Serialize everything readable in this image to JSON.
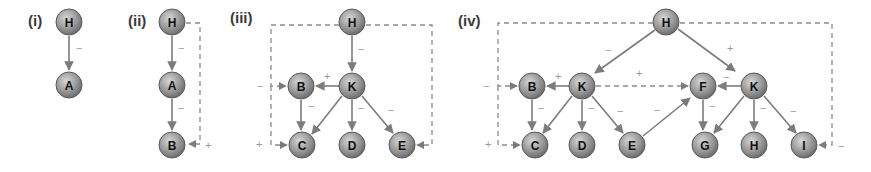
{
  "diagram": {
    "colors": {
      "node_fill": "#8f8f8f",
      "node_highlight": "#d8d8d8",
      "node_stroke": "#5a5a5a",
      "edge": "#7c7c7c",
      "sign": "#9a9a9a",
      "label": "#111111"
    },
    "panels": [
      {
        "label": "(i)",
        "nodes": [
          {
            "id": "H",
            "label": "H"
          },
          {
            "id": "A",
            "label": "A"
          }
        ],
        "edges": [
          {
            "from": "H",
            "to": "A",
            "sign": "−",
            "style": "solid"
          }
        ]
      },
      {
        "label": "(ii)",
        "nodes": [
          {
            "id": "H",
            "label": "H"
          },
          {
            "id": "A",
            "label": "A"
          },
          {
            "id": "B",
            "label": "B"
          }
        ],
        "edges": [
          {
            "from": "H",
            "to": "A",
            "sign": "−",
            "style": "solid"
          },
          {
            "from": "A",
            "to": "B",
            "sign": "−",
            "style": "solid"
          },
          {
            "from": "H",
            "to": "B",
            "sign": "+",
            "style": "dashed"
          }
        ]
      },
      {
        "label": "(iii)",
        "nodes": [
          {
            "id": "H",
            "label": "H"
          },
          {
            "id": "K",
            "label": "K"
          },
          {
            "id": "B",
            "label": "B"
          },
          {
            "id": "C",
            "label": "C"
          },
          {
            "id": "D",
            "label": "D"
          },
          {
            "id": "E",
            "label": "E"
          }
        ],
        "edges": [
          {
            "from": "H",
            "to": "K",
            "sign": "−",
            "style": "solid"
          },
          {
            "from": "K",
            "to": "B",
            "sign": "+",
            "style": "solid"
          },
          {
            "from": "B",
            "to": "C",
            "sign": "",
            "style": "solid"
          },
          {
            "from": "K",
            "to": "C",
            "sign": "−",
            "style": "solid"
          },
          {
            "from": "K",
            "to": "D",
            "sign": "−",
            "style": "solid"
          },
          {
            "from": "K",
            "to": "E",
            "sign": "−",
            "style": "solid"
          },
          {
            "from": "H",
            "to": "B",
            "sign": "−",
            "style": "dashed"
          },
          {
            "from": "H",
            "to": "C",
            "sign": "+",
            "style": "dashed"
          },
          {
            "from": "H",
            "to": "E",
            "sign": "",
            "style": "dashed"
          }
        ]
      },
      {
        "label": "(iv)",
        "nodes": [
          {
            "id": "H",
            "label": "H"
          },
          {
            "id": "K1",
            "label": "K"
          },
          {
            "id": "B",
            "label": "B"
          },
          {
            "id": "C",
            "label": "C"
          },
          {
            "id": "D",
            "label": "D"
          },
          {
            "id": "E",
            "label": "E"
          },
          {
            "id": "F",
            "label": "F"
          },
          {
            "id": "K2",
            "label": "K"
          },
          {
            "id": "G",
            "label": "G"
          },
          {
            "id": "H2",
            "label": "H"
          },
          {
            "id": "I",
            "label": "I"
          }
        ],
        "edges": [
          {
            "from": "H",
            "to": "K1",
            "sign": "−",
            "style": "solid"
          },
          {
            "from": "H",
            "to": "K2",
            "sign": "+",
            "style": "solid"
          },
          {
            "from": "K1",
            "to": "B",
            "sign": "+",
            "style": "solid"
          },
          {
            "from": "B",
            "to": "C",
            "sign": "",
            "style": "solid"
          },
          {
            "from": "K1",
            "to": "C",
            "sign": "−",
            "style": "solid"
          },
          {
            "from": "K1",
            "to": "D",
            "sign": "−",
            "style": "solid"
          },
          {
            "from": "K1",
            "to": "E",
            "sign": "−",
            "style": "solid"
          },
          {
            "from": "E",
            "to": "F",
            "sign": "−",
            "style": "solid"
          },
          {
            "from": "K2",
            "to": "F",
            "sign": "−",
            "style": "solid"
          },
          {
            "from": "F",
            "to": "G",
            "sign": "",
            "style": "solid"
          },
          {
            "from": "K2",
            "to": "G",
            "sign": "−",
            "style": "solid"
          },
          {
            "from": "K2",
            "to": "H2",
            "sign": "−",
            "style": "solid"
          },
          {
            "from": "K2",
            "to": "I",
            "sign": "−",
            "style": "solid"
          },
          {
            "from": "K1",
            "to": "F",
            "sign": "+",
            "style": "dashed"
          },
          {
            "from": "H",
            "to": "B",
            "sign": "−",
            "style": "dashed"
          },
          {
            "from": "H",
            "to": "C",
            "sign": "+",
            "style": "dashed"
          },
          {
            "from": "H",
            "to": "I",
            "sign": "−",
            "style": "dashed"
          }
        ]
      }
    ]
  },
  "text": {
    "p1": "(i)",
    "p2": "(ii)",
    "p3": "(iii)",
    "p4": "(iv)",
    "minus": "−",
    "plus": "+",
    "H": "H",
    "A": "A",
    "B": "B",
    "C": "C",
    "D": "D",
    "E": "E",
    "F": "F",
    "G": "G",
    "I": "I",
    "K": "K"
  }
}
